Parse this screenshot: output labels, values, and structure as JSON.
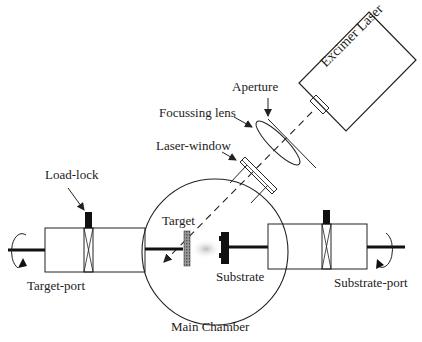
{
  "diagram": {
    "type": "pulsed-laser-deposition-system",
    "labels": {
      "excimer_laser": "Excimer Laser",
      "aperture": "Aperture",
      "focussing_lens": "Focussing lens",
      "laser_window": "Laser-window",
      "load_lock": "Load-lock",
      "target": "Target",
      "substrate": "Substrate",
      "target_port": "Target-port",
      "substrate_port": "Substrate-port",
      "main_chamber": "Main Chamber"
    },
    "colors": {
      "line": "#222222",
      "fill_dark": "#111111",
      "target_fill": "#777777",
      "plume": "#cccccc"
    }
  }
}
